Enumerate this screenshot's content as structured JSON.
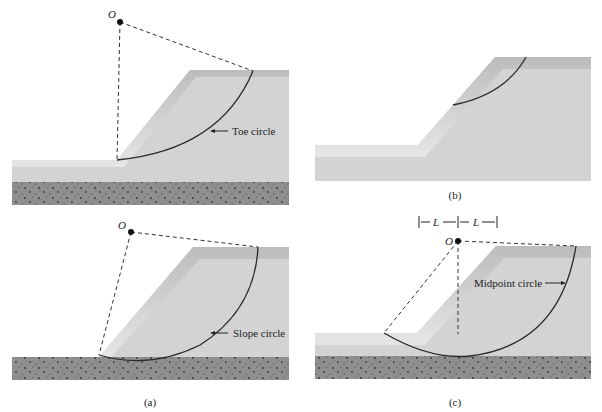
{
  "figure": {
    "panels": [
      {
        "id": "a-top",
        "circle_label": "Toe circle",
        "center_label": "O"
      },
      {
        "id": "b",
        "caption": "(b)"
      },
      {
        "id": "a-bottom",
        "circle_label": "Slope circle",
        "center_label": "O",
        "caption": "(a)"
      },
      {
        "id": "c",
        "circle_label": "Midpoint circle",
        "center_label": "O",
        "caption": "(c)",
        "dimension_label_left": "L",
        "dimension_label_right": "L"
      }
    ]
  },
  "colors": {
    "soil": "#d2d2d2",
    "soil_top_band": "#bdbdbd",
    "rock": "#8e8e8e",
    "line": "#2a2a2a"
  }
}
